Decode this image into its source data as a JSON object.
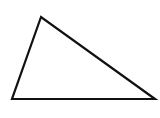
{
  "diagram": {
    "shape": "triangle",
    "background": "#ffffff",
    "stroke_color": "#111111",
    "fill_color": "#ffffff",
    "stroke_width": 2.2,
    "vertices": [
      {
        "name": "top",
        "x": 41,
        "y": 17
      },
      {
        "name": "bottom-left",
        "x": 12,
        "y": 99
      },
      {
        "name": "bottom-right",
        "x": 155,
        "y": 99
      }
    ]
  }
}
